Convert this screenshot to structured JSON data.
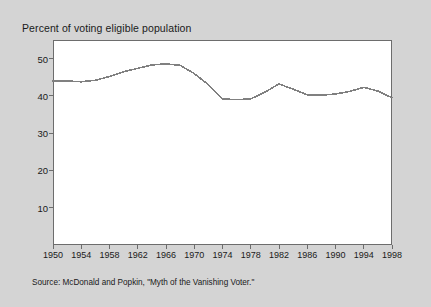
{
  "title": "Percent of voting eligible population",
  "source": "Source:  McDonald and Popkin, \"Myth of the Vanishing Voter.\"",
  "colors": {
    "background": "#d4d4d4",
    "plot_background": "#ffffff",
    "line": "#808080",
    "axis": "#6d6d6d",
    "text": "#1a1a1a"
  },
  "chart_data": {
    "type": "line",
    "title": "Percent of voting eligible population",
    "xlabel": "",
    "ylabel": "",
    "xlim": [
      1950,
      1998
    ],
    "ylim": [
      0,
      55
    ],
    "yticks": [
      10,
      20,
      30,
      40,
      50
    ],
    "xticks": [
      1950,
      1954,
      1958,
      1962,
      1966,
      1970,
      1974,
      1978,
      1982,
      1986,
      1990,
      1994,
      1998
    ],
    "grid": false,
    "legend": null,
    "x": [
      1950,
      1952,
      1954,
      1956,
      1958,
      1960,
      1962,
      1964,
      1966,
      1968,
      1970,
      1972,
      1974,
      1976,
      1978,
      1980,
      1982,
      1984,
      1986,
      1988,
      1990,
      1992,
      1994,
      1996,
      1998
    ],
    "values": [
      44.0,
      44.0,
      43.8,
      44.2,
      45.2,
      46.5,
      47.4,
      48.3,
      48.6,
      48.2,
      46.0,
      43.0,
      39.2,
      39.0,
      39.2,
      41.0,
      43.2,
      41.8,
      40.3,
      40.2,
      40.5,
      41.2,
      42.3,
      41.3,
      39.5
    ],
    "series": [
      {
        "name": "Percent of voting eligible population",
        "values": [
          44.0,
          44.0,
          43.8,
          44.2,
          45.2,
          46.5,
          47.4,
          48.3,
          48.6,
          48.2,
          46.0,
          43.0,
          39.2,
          39.0,
          39.2,
          41.0,
          43.2,
          41.8,
          40.3,
          40.2,
          40.5,
          41.2,
          42.3,
          41.3,
          39.5
        ]
      }
    ]
  }
}
